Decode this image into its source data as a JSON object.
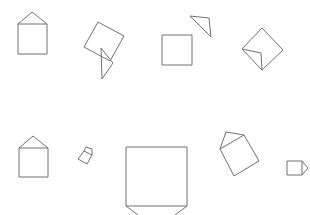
{
  "canvas": {
    "width": 310,
    "height": 215,
    "background": "#ffffff",
    "stroke_color": "#707070"
  },
  "rows": [
    {
      "name": "top-row",
      "figures": [
        {
          "name": "house-figure",
          "square": "18,24 47,24 47,54 18,54",
          "roof": "18,24 32,12 47,24"
        },
        {
          "name": "tilted-square-with-triangle",
          "square": "98,22 124,36 110,61 84,47",
          "roof": "101,48 113,63 102,79"
        },
        {
          "name": "square-with-detached-triangle",
          "square": "162,35 192,35 192,65 162,65",
          "roof": "190,16 209,18 211,37"
        },
        {
          "name": "diamond-with-fold",
          "square": "262,28 283,50 262,70 242,49",
          "roof": "242,49 261,53 262,70"
        }
      ]
    },
    {
      "name": "bottom-row",
      "figures": [
        {
          "name": "house-figure",
          "square": "19,148 48,148 48,177 19,177",
          "roof": "19,148 33,136 48,148"
        },
        {
          "name": "small-tilted-house",
          "square": "84,151 92,155 87,164 78,159",
          "roof": "84,151 86,147 92,149 92,155"
        },
        {
          "name": "large-square-with-legs",
          "square": "126,147 187,147 187,206 126,206",
          "roof": "126,206 137,215 M187,206 176,215"
        },
        {
          "name": "tilted-square-with-roof",
          "square": "220,149 244,135 259,161 234,176",
          "roof": "220,149 226,132 244,135"
        },
        {
          "name": "small-house-sideways",
          "square": "287,161 302,161 302,175 287,175",
          "roof": "302,161 308,168 302,175"
        }
      ]
    }
  ]
}
